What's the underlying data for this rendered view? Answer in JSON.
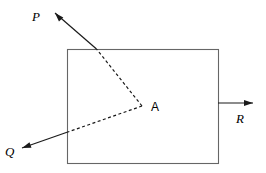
{
  "figure": {
    "type": "vector-force-diagram",
    "width": 266,
    "height": 173,
    "background_color": "#ffffff",
    "stroke_color": "#1a1a1a",
    "rect_stroke_color": "#666666"
  },
  "body_rect": {
    "name": "rigid-body-rectangle",
    "x": 67,
    "y": 49,
    "width": 151,
    "height": 114,
    "stroke_width": 1.1
  },
  "point": {
    "label": "A",
    "x": 142,
    "y": 106,
    "label_x": 151,
    "label_y": 111
  },
  "vectors": [
    {
      "id": "P",
      "label": "P",
      "from_x": 142,
      "from_y": 106,
      "to_x": 55,
      "to_y": 13,
      "boundary_x": 96.5,
      "boundary_y": 49,
      "dashed_inside": true,
      "label_x": 32,
      "label_y": 21
    },
    {
      "id": "Q",
      "label": "Q",
      "from_x": 142,
      "from_y": 106,
      "to_x": 22,
      "to_y": 148,
      "boundary_x": 67,
      "boundary_y": 132.3,
      "dashed_inside": true,
      "label_x": 5,
      "label_y": 156
    },
    {
      "id": "R",
      "label": "R",
      "from_x": 218,
      "from_y": 103,
      "to_x": 253,
      "to_y": 103,
      "boundary_x": 218,
      "boundary_y": 103,
      "dashed_inside": false,
      "label_x": 236,
      "label_y": 123
    }
  ],
  "style": {
    "dash_pattern": "3,2.5",
    "line_width": 1.2,
    "arrow_length": 9,
    "arrow_width": 6
  }
}
